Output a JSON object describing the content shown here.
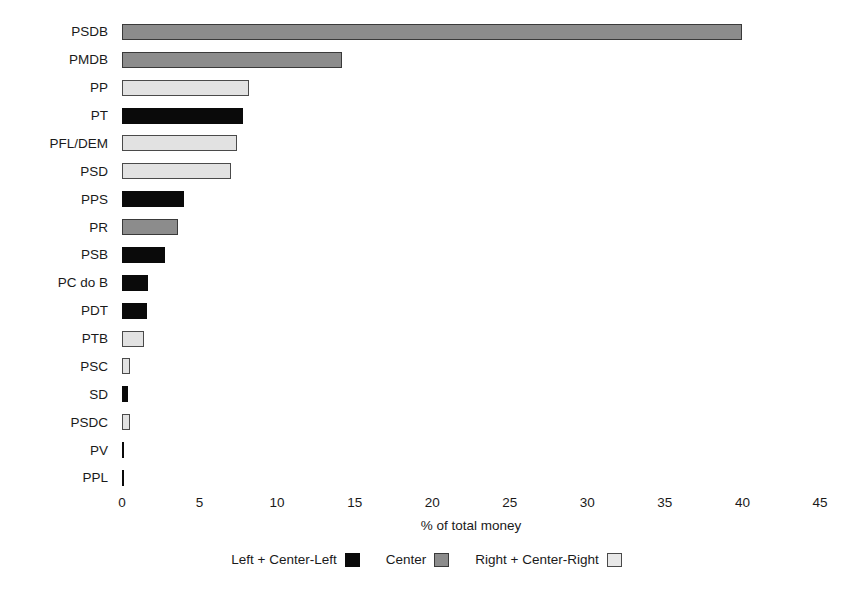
{
  "chart_data": {
    "type": "bar",
    "orientation": "horizontal",
    "title": "",
    "xlabel": "% of total money",
    "ylabel": "Party",
    "xlim": [
      0,
      45
    ],
    "xticks": [
      0,
      5,
      10,
      15,
      20,
      25,
      30,
      35,
      40,
      45
    ],
    "grid": false,
    "legend_position": "bottom",
    "categories": [
      "PSDB",
      "PMDB",
      "PP",
      "PT",
      "PFL/DEM",
      "PSD",
      "PPS",
      "PR",
      "PSB",
      "PC do B",
      "PDT",
      "PTB",
      "PSC",
      "SD",
      "PSDC",
      "PV",
      "PPL"
    ],
    "values": [
      40.0,
      14.2,
      8.2,
      7.8,
      7.4,
      7.0,
      4.0,
      3.6,
      2.8,
      1.7,
      1.6,
      1.4,
      0.5,
      0.4,
      0.5,
      0.12,
      0.12
    ],
    "groups": [
      "center",
      "center",
      "right",
      "left",
      "right",
      "right",
      "left",
      "center",
      "left",
      "left",
      "left",
      "right",
      "right",
      "left",
      "right",
      "left",
      "left"
    ],
    "bars": [
      {
        "category": "PSDB",
        "value": 40.0,
        "group": "center"
      },
      {
        "category": "PMDB",
        "value": 14.2,
        "group": "center"
      },
      {
        "category": "PP",
        "value": 8.2,
        "group": "right"
      },
      {
        "category": "PT",
        "value": 7.8,
        "group": "left"
      },
      {
        "category": "PFL/DEM",
        "value": 7.4,
        "group": "right"
      },
      {
        "category": "PSD",
        "value": 7.0,
        "group": "right"
      },
      {
        "category": "PPS",
        "value": 4.0,
        "group": "left"
      },
      {
        "category": "PR",
        "value": 3.6,
        "group": "center"
      },
      {
        "category": "PSB",
        "value": 2.8,
        "group": "left"
      },
      {
        "category": "PC do B",
        "value": 1.7,
        "group": "left"
      },
      {
        "category": "PDT",
        "value": 1.6,
        "group": "left"
      },
      {
        "category": "PTB",
        "value": 1.4,
        "group": "right"
      },
      {
        "category": "PSC",
        "value": 0.5,
        "group": "right"
      },
      {
        "category": "SD",
        "value": 0.4,
        "group": "left"
      },
      {
        "category": "PSDC",
        "value": 0.5,
        "group": "right"
      },
      {
        "category": "PV",
        "value": 0.12,
        "group": "left"
      },
      {
        "category": "PPL",
        "value": 0.12,
        "group": "left"
      }
    ],
    "legend": [
      {
        "label": "Left + Center-Left",
        "group": "left",
        "color": "#0a0a0a"
      },
      {
        "label": "Center",
        "group": "center",
        "color": "#8c8c8c"
      },
      {
        "label": "Right + Center-Right",
        "group": "right",
        "color": "#e8e8e8"
      }
    ]
  }
}
